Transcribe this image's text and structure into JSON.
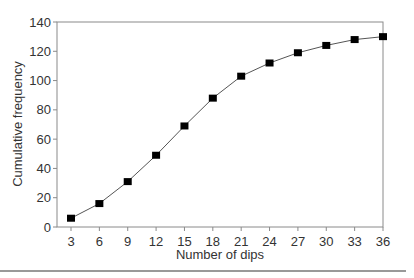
{
  "chart_data": {
    "type": "line",
    "title": "",
    "xlabel": "Number of dips",
    "ylabel": "Cumulative frequency",
    "x": [
      3,
      6,
      9,
      12,
      15,
      18,
      21,
      24,
      27,
      30,
      33,
      36
    ],
    "categories": [
      "3",
      "6",
      "9",
      "12",
      "15",
      "18",
      "21",
      "24",
      "27",
      "30",
      "33",
      "36"
    ],
    "series": [
      {
        "name": "Cumulative frequency",
        "values": [
          6,
          16,
          31,
          49,
          69,
          88,
          103,
          112,
          119,
          124,
          128,
          130
        ]
      }
    ],
    "yticks": [
      0,
      20,
      40,
      60,
      80,
      100,
      120,
      140
    ],
    "ylim": [
      0,
      140
    ],
    "grid": false,
    "legend": "none",
    "marker": "square",
    "colors": {
      "line": "#555555",
      "marker": "#000000",
      "axis": "#888888"
    }
  }
}
